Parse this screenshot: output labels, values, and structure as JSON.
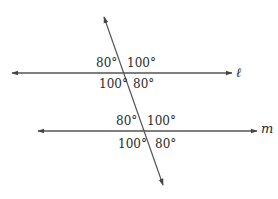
{
  "diagram": {
    "type": "parallel-lines-transversal",
    "colors": {
      "line": "#555555",
      "text": "#2a2a2a",
      "background": "#ffffff"
    },
    "lines": {
      "l": {
        "name": "ℓ"
      },
      "m": {
        "name": "m"
      }
    },
    "angles_at_l": {
      "top_left": "80°",
      "top_right": "100°",
      "bottom_left": "100°",
      "bottom_right": "80°"
    },
    "angles_at_m": {
      "top_left": "80°",
      "top_right": "100°",
      "bottom_left": "100°",
      "bottom_right": "80°"
    }
  }
}
